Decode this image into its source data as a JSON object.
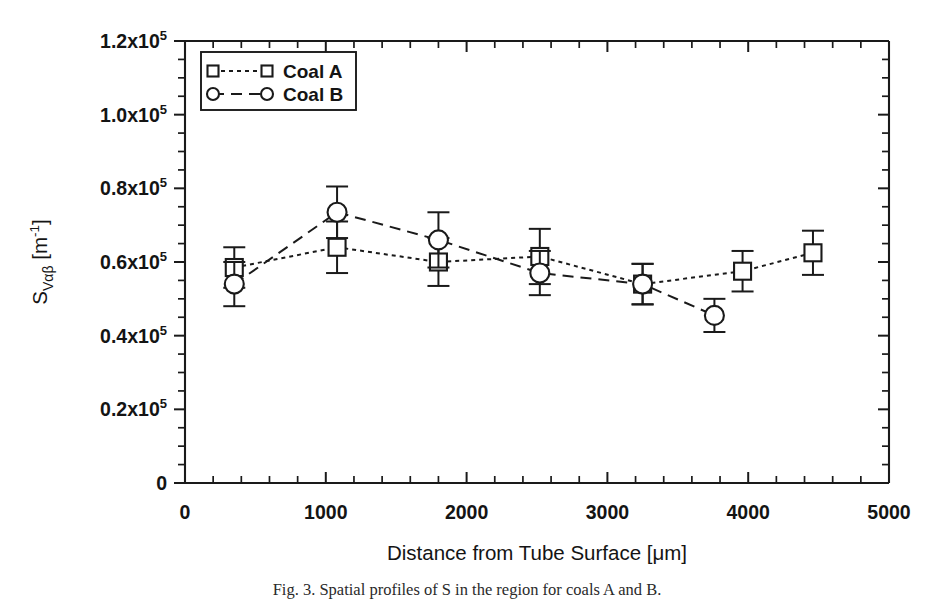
{
  "figure": {
    "caption": "Fig. 3. Spatial profiles of S  in the region for coals A and B."
  },
  "chart_data": {
    "type": "line",
    "title": "",
    "xlabel": "Distance from Tube Surface [μm]",
    "ylabel_main": "S",
    "ylabel_sub": "Vαβ",
    "ylabel_unit_open": " [m",
    "ylabel_unit_sup": "-1",
    "ylabel_unit_close": "]",
    "xlim": [
      0,
      5000
    ],
    "ylim": [
      0,
      120000
    ],
    "grid": false,
    "legend_position": "top-left-inside",
    "x_major_ticks": [
      0,
      1000,
      2000,
      3000,
      4000,
      5000
    ],
    "x_tick_labels": [
      "0",
      "1000",
      "2000",
      "3000",
      "4000",
      "5000"
    ],
    "x_minor_interval": 200,
    "y_major_ticks": [
      0,
      20000,
      40000,
      60000,
      80000,
      100000,
      120000
    ],
    "y_tick_labels": [
      "0",
      "0.2x10",
      "0.4x10",
      "0.6x10",
      "0.8x10",
      "1.0x10",
      "1.2x10"
    ],
    "y_tick_exponent": "5",
    "y_minor_interval": 5000,
    "series": [
      {
        "name": "Coal A",
        "marker": "square",
        "linestyle": "dotted",
        "x": [
          350,
          1080,
          1800,
          2520,
          3250,
          3960,
          4460
        ],
        "y": [
          58500,
          64000,
          60000,
          61500,
          54000,
          57500,
          62500
        ],
        "yerr": [
          5500,
          7000,
          6500,
          7500,
          5500,
          5500,
          6000
        ]
      },
      {
        "name": "Coal B",
        "marker": "circle",
        "linestyle": "dashed",
        "x": [
          350,
          1080,
          1800,
          2520,
          3250,
          3760
        ],
        "y": [
          54000,
          73500,
          66000,
          57000,
          54000,
          45500
        ],
        "yerr": [
          6000,
          7000,
          7500,
          6000,
          5500,
          4500
        ]
      }
    ]
  }
}
